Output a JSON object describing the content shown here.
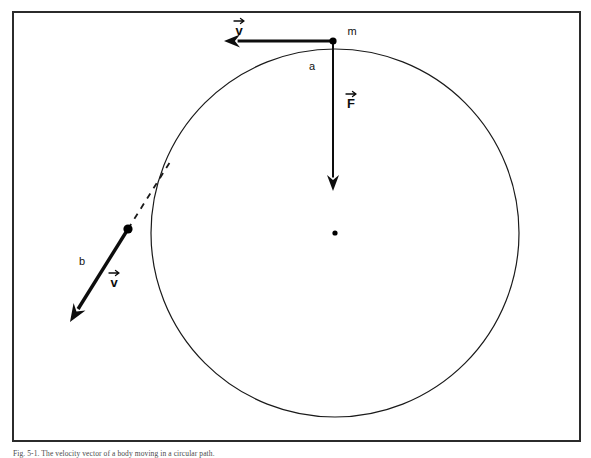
{
  "figure": {
    "domain_kind": "physics-diagram",
    "background_color": "#ffffff",
    "ink_color": "#111111",
    "frame": {
      "name": "outer-border",
      "x": 13,
      "y": 12,
      "width": 567,
      "height": 429,
      "stroke_color": "#2b2b2b",
      "stroke_width": 2
    },
    "circle": {
      "name": "orbit-path",
      "center_x": 335,
      "center_y": 233,
      "radius": 184,
      "stroke_color": "#1a1a1a",
      "stroke_width": 1.2,
      "fill": "none"
    },
    "center_dot": {
      "name": "orbit-center-dot",
      "x": 335,
      "y": 233,
      "radius": 2.6,
      "color": "#000000"
    },
    "mass_dot": {
      "name": "mass-point-dot",
      "x": 333,
      "y": 41,
      "radius": 3.6,
      "color": "#000000"
    },
    "tangent_dot": {
      "name": "release-point-dot",
      "x": 128,
      "y": 229,
      "radius": 4.6,
      "color": "#000000"
    },
    "vectors": [
      {
        "name": "velocity-vector-a",
        "label": "v",
        "label_has_arrow_accent": true,
        "label_x": 239,
        "label_y": 28,
        "x1": 333,
        "y1": 41,
        "x2": 224,
        "y2": 41,
        "stroke_width": 3.2,
        "head_length": 16,
        "head_width": 13,
        "direction": "left",
        "color": "#0d0d0d"
      },
      {
        "name": "force-vector",
        "label": "F",
        "label_has_arrow_accent": true,
        "label_x": 351,
        "label_y": 101,
        "x1": 333,
        "y1": 41,
        "x2": 333,
        "y2": 191,
        "stroke_width": 2.0,
        "head_length": 16,
        "head_width": 12,
        "direction": "down",
        "color": "#0d0d0d"
      },
      {
        "name": "velocity-vector-b",
        "label": "v",
        "label_has_arrow_accent": true,
        "label_x": 114,
        "label_y": 280,
        "x1": 128,
        "y1": 229,
        "x2": 70,
        "y2": 322,
        "stroke_width": 3.4,
        "head_length": 18,
        "head_width": 14,
        "direction": "down-left",
        "color": "#0d0d0d"
      }
    ],
    "dashed_line": {
      "name": "tangent-extension-dashed-line",
      "x1": 128,
      "y1": 229,
      "x2": 170,
      "y2": 162,
      "stroke_width": 1.8,
      "dash_pattern": "6 6",
      "color": "#1a1a1a"
    },
    "point_labels": [
      {
        "name": "mass-label-m",
        "text": "m",
        "x": 352,
        "y": 32
      },
      {
        "name": "position-label-a",
        "text": "a",
        "x": 312,
        "y": 67
      },
      {
        "name": "position-label-b",
        "text": "b",
        "x": 82,
        "y": 262
      }
    ],
    "caption": {
      "name": "figure-caption",
      "text": "Fig. 5-1. The velocity vector of a body moving in a circular path."
    }
  }
}
